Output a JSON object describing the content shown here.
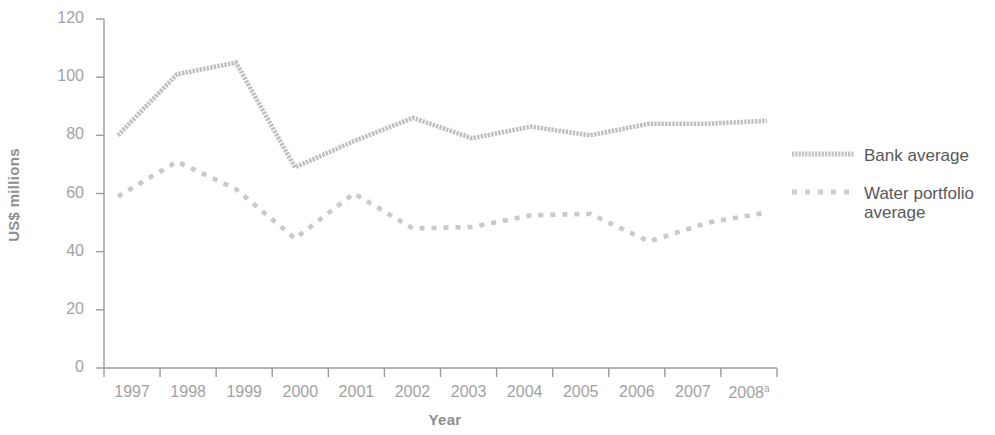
{
  "chart_data": {
    "type": "line",
    "title": "",
    "xlabel": "Year",
    "ylabel": "US$ millions",
    "categories": [
      "1997",
      "1998",
      "1999",
      "2000",
      "2001",
      "2002",
      "2003",
      "2004",
      "2005",
      "2006",
      "2007",
      "2008"
    ],
    "xtick_labels": [
      "1997",
      "1998",
      "1999",
      "2000",
      "2001",
      "2002",
      "2003",
      "2004",
      "2005",
      "2006",
      "2007",
      "2008"
    ],
    "last_category_footnote": "a",
    "ytick_labels": [
      "0",
      "20",
      "40",
      "60",
      "80",
      "100",
      "120"
    ],
    "ytick_values": [
      0,
      20,
      40,
      60,
      80,
      100,
      120
    ],
    "ylim": [
      0,
      120
    ],
    "grid": false,
    "legend_position": "right",
    "series": [
      {
        "name": "Bank average",
        "style": "dotted",
        "color": "#bfbfbf",
        "values": [
          80,
          101,
          105,
          69,
          78,
          86,
          79,
          83,
          80,
          84,
          84,
          85
        ]
      },
      {
        "name": "Water portfolio average",
        "style": "dashed",
        "color": "#c9c9c9",
        "values": [
          59,
          71,
          61.5,
          44.5,
          60,
          48,
          48.5,
          52.5,
          53,
          43.5,
          50,
          53.5
        ]
      }
    ]
  },
  "legend": {
    "items": [
      {
        "label": "Bank average",
        "key": "dotted-line-key"
      },
      {
        "label": "Water portfolio\naverage",
        "key": "dashed-line-key"
      }
    ]
  },
  "axes": {
    "x_title": "Year",
    "y_title": "US$ millions"
  }
}
